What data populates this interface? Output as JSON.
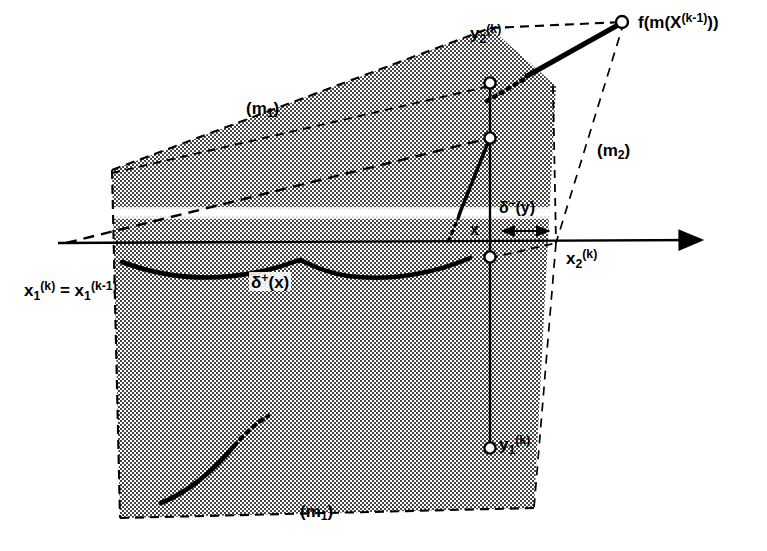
{
  "figure": {
    "background_color": "#ffffff",
    "ink_color": "#000000",
    "shade_color": "#b0b0b0"
  },
  "labels": {
    "m1_top": {
      "base": "(m",
      "sub": "1",
      "tail": ")"
    },
    "m1_bottom": {
      "base": "(m",
      "sub": "1",
      "tail": ")"
    },
    "m2_right": {
      "base": "(m",
      "sub": "2",
      "tail": ")"
    },
    "y2": {
      "base": "y",
      "sub": "2",
      "sup": "(k)"
    },
    "y1": {
      "base": "y",
      "sub": "1",
      "sup": "(k)"
    },
    "x2": {
      "base": "x",
      "sub": "2",
      "sup": "(k)"
    },
    "x1_equation": {
      "lhs_base": "x",
      "lhs_sub": "1",
      "lhs_sup": "(k)",
      "eq": " = ",
      "rhs_base": "x",
      "rhs_sub": "1",
      "rhs_sup": "(k-1)"
    },
    "f_of_m": {
      "pre": "f(m(X",
      "sup": "(k-1)",
      "post": "))"
    },
    "delta_plus": {
      "base": "δ",
      "sup": "+",
      "arg": "(x)"
    },
    "delta_minus": {
      "base": "δ",
      "sup": "−",
      "arg": "(y)"
    },
    "x_point": "x"
  },
  "geometry": {
    "axis": {
      "x1": 58,
      "y1": 243,
      "x2": 710,
      "y2": 240,
      "arrow": true
    },
    "polygon_outer": [
      [
        112,
        170
      ],
      [
        490,
        28
      ],
      [
        556,
        86
      ],
      [
        534,
        508
      ],
      [
        120,
        518
      ]
    ],
    "vertical_solid": {
      "x": 490,
      "y_top": 83,
      "y_bottom": 448
    },
    "vertical_dashed_left": {
      "x": 112,
      "y_top": 170,
      "y_bottom": 518
    },
    "vertical_dashed_right": {
      "x": 556,
      "y_top": 86,
      "y_bottom": 243
    },
    "nodes": [
      {
        "name": "y2-node",
        "cx": 490,
        "cy": 83
      },
      {
        "name": "mid-node",
        "cx": 490,
        "cy": 138
      },
      {
        "name": "axis-node",
        "cx": 490,
        "cy": 257
      },
      {
        "name": "y1-node",
        "cx": 490,
        "cy": 448
      },
      {
        "name": "fmx-node",
        "cx": 624,
        "cy": 22
      }
    ],
    "white_band": {
      "x": 112,
      "y": 208,
      "width": 445,
      "height": 11
    },
    "delta_minus_arrow": {
      "x1": 500,
      "x2": 552,
      "y": 231
    }
  }
}
